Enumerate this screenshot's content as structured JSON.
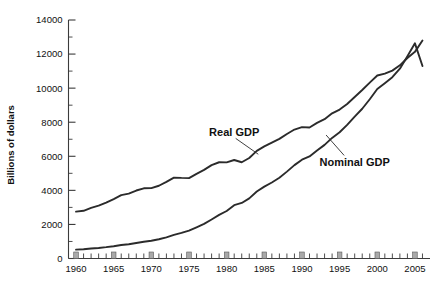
{
  "chart_data": {
    "type": "line",
    "title": "",
    "xlabel": "",
    "ylabel": "Billions of dollars",
    "xlim": [
      1959,
      2007
    ],
    "ylim": [
      0,
      14000
    ],
    "ytick_labels": [
      "0",
      "2000",
      "4000",
      "6000",
      "8000",
      "10000",
      "12000",
      "14000"
    ],
    "ytick_values": [
      0,
      2000,
      4000,
      6000,
      8000,
      10000,
      12000,
      14000
    ],
    "xtick_labels": [
      "1960",
      "1965",
      "1970",
      "1975",
      "1980",
      "1985",
      "1990",
      "1995",
      "2000",
      "2005"
    ],
    "xtick_values": [
      1960,
      1965,
      1970,
      1975,
      1980,
      1985,
      1990,
      1995,
      2000,
      2005
    ],
    "grid": false,
    "legend_position": "inline-annotation",
    "annotations": [
      {
        "text": "Real GDP",
        "x": 1981,
        "y": 7400
      },
      {
        "text": "Nominal GDP",
        "x": 1997,
        "y": 5650
      }
    ],
    "series": [
      {
        "name": "Real GDP",
        "label": "Real GDP",
        "color": "#2b2b2b",
        "x": [
          1960,
          1961,
          1962,
          1963,
          1964,
          1965,
          1966,
          1967,
          1968,
          1969,
          1970,
          1971,
          1972,
          1973,
          1974,
          1975,
          1976,
          1977,
          1978,
          1979,
          1980,
          1981,
          1982,
          1983,
          1984,
          1985,
          1986,
          1987,
          1988,
          1989,
          1990,
          1991,
          1992,
          1993,
          1994,
          1995,
          1996,
          1997,
          1998,
          1999,
          2000,
          2001,
          2002,
          2003,
          2004,
          2005,
          2006
        ],
        "values": [
          2750,
          2800,
          2970,
          3100,
          3280,
          3490,
          3720,
          3810,
          3990,
          4120,
          4130,
          4270,
          4500,
          4750,
          4730,
          4720,
          4970,
          5200,
          5480,
          5650,
          5640,
          5780,
          5650,
          5900,
          6320,
          6580,
          6800,
          7020,
          7310,
          7570,
          7710,
          7690,
          7960,
          8180,
          8520,
          8740,
          9070,
          9480,
          9890,
          10320,
          10740,
          10850,
          11030,
          11340,
          11770,
          12130,
          12800
        ]
      },
      {
        "name": "Nominal GDP",
        "label": "Nominal GDP",
        "color": "#2b2b2b",
        "x": [
          1960,
          1961,
          1962,
          1963,
          1964,
          1965,
          1966,
          1967,
          1968,
          1969,
          1970,
          1971,
          1972,
          1973,
          1974,
          1975,
          1976,
          1977,
          1978,
          1979,
          1980,
          1981,
          1982,
          1983,
          1984,
          1985,
          1986,
          1987,
          1988,
          1989,
          1990,
          1991,
          1992,
          1993,
          1994,
          1995,
          1996,
          1997,
          1998,
          1999,
          2000,
          2001,
          2002,
          2003,
          2004,
          2005,
          2006
        ],
        "values": [
          520,
          545,
          585,
          620,
          665,
          720,
          790,
          835,
          910,
          985,
          1040,
          1130,
          1240,
          1385,
          1500,
          1640,
          1830,
          2030,
          2290,
          2560,
          2790,
          3130,
          3260,
          3530,
          3930,
          4220,
          4460,
          4740,
          5100,
          5480,
          5800,
          5990,
          6340,
          6670,
          7080,
          7410,
          7840,
          8330,
          8790,
          9350,
          9950,
          10290,
          10640,
          11140,
          11870,
          12630,
          11300
        ]
      }
    ]
  },
  "axis": {
    "y_title": "Billions of dollars"
  }
}
